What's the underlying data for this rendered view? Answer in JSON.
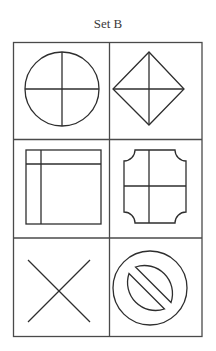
{
  "title": "Set B",
  "grid": {
    "rows": 3,
    "columns": 2,
    "line_color": "#4a4a4a",
    "shape_color": "#2e2e2e"
  },
  "cells": [
    {
      "row": 1,
      "col": 1,
      "shape": "circle-with-cross",
      "label": "Circle divided into four quadrants"
    },
    {
      "row": 1,
      "col": 2,
      "shape": "diamond-with-cross",
      "label": "Diamond divided into four triangles"
    },
    {
      "row": 2,
      "col": 1,
      "shape": "square-with-offset-cross",
      "label": "Square with lines near top and left edges"
    },
    {
      "row": 2,
      "col": 2,
      "shape": "notched-rectangle-with-cross",
      "label": "Rectangle with concave corners divided into four"
    },
    {
      "row": 3,
      "col": 1,
      "shape": "x-cross",
      "label": "Two crossing diagonal lines"
    },
    {
      "row": 3,
      "col": 2,
      "shape": "prohibition-sign",
      "label": "Circle with diagonal bar (prohibition sign)"
    }
  ]
}
